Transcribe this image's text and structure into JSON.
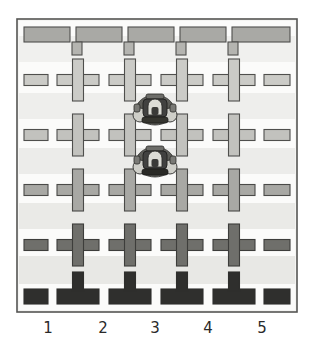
{
  "figure": {
    "kind": "micrograph-diagram",
    "title": "",
    "caption": ""
  },
  "axis": {
    "column_labels": [
      "1",
      "2",
      "3",
      "4",
      "5"
    ],
    "label_x_positions": [
      48,
      103,
      155,
      208,
      262
    ],
    "label_y": 318
  },
  "frame": {
    "outer_border_color": "#3a3a3a",
    "inner_fill_color": "#f2f2f0",
    "x": 17,
    "y": 19,
    "width": 280,
    "height": 293
  },
  "palette": {
    "wall_light": "#d6d6d2",
    "wall_mid": "#bfbfbb",
    "wall_dark": "#8d8d89",
    "wall_darkest": "#2b2b2b",
    "outline": "#4a4a4a",
    "background": "#ffffff",
    "channel": "#ffffff",
    "band": "#ededea"
  },
  "grid": {
    "rows": 4,
    "cols": 4,
    "cross_pitch_x": 52,
    "cross_pitch_y": 55,
    "cross_origin_x": 78,
    "cross_origin_y": 80,
    "cross_arm_length": 21,
    "cross_arm_thickness": 11
  },
  "objects": [
    {
      "name": "micro-robot-upper",
      "label": "",
      "column": "3",
      "cx": 155,
      "cy": 109,
      "width": 38,
      "height": 32,
      "color": "#3b3b3b"
    },
    {
      "name": "micro-robot-lower",
      "label": "",
      "column": "3",
      "cx": 155,
      "cy": 161,
      "width": 38,
      "height": 32,
      "color": "#3b3b3b"
    }
  ],
  "shading_bands": [
    {
      "y": 95,
      "height": 22,
      "color": "#ebebe8"
    },
    {
      "y": 150,
      "height": 22,
      "color": "#e9e9e6"
    },
    {
      "y": 205,
      "height": 22,
      "color": "#e7e7e4"
    },
    {
      "y": 258,
      "height": 24,
      "color": "#e4e4e1"
    }
  ]
}
